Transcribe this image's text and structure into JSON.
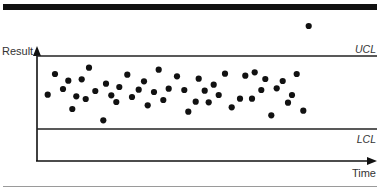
{
  "chart_data": {
    "type": "scatter",
    "title": "",
    "xlabel": "Time",
    "ylabel": "Result",
    "control_limits": [
      {
        "name": "UCL",
        "label": "UCL",
        "y_px": 56
      },
      {
        "name": "LCL",
        "label": "LCL",
        "y_px": 129
      }
    ],
    "grid": false,
    "legend": null,
    "points_px": [
      [
        47.7,
        94.7
      ],
      [
        55,
        74
      ],
      [
        63,
        89
      ],
      [
        68.3,
        80.7
      ],
      [
        72.3,
        109
      ],
      [
        76.3,
        96.3
      ],
      [
        81.7,
        79.3
      ],
      [
        85.7,
        99
      ],
      [
        89,
        67.7
      ],
      [
        95.3,
        91
      ],
      [
        103.3,
        120.3
      ],
      [
        106,
        83.7
      ],
      [
        111.3,
        95.3
      ],
      [
        116.3,
        102
      ],
      [
        119.3,
        87
      ],
      [
        127.3,
        74.7
      ],
      [
        132,
        97
      ],
      [
        138.7,
        89.7
      ],
      [
        144,
        81.3
      ],
      [
        147.7,
        105.3
      ],
      [
        154,
        92
      ],
      [
        158.7,
        69.7
      ],
      [
        163.3,
        100
      ],
      [
        168.7,
        88.7
      ],
      [
        177,
        76.3
      ],
      [
        184.3,
        90
      ],
      [
        188.3,
        111.7
      ],
      [
        195.7,
        101.7
      ],
      [
        198.7,
        78.7
      ],
      [
        204.7,
        90.7
      ],
      [
        208.7,
        102.3
      ],
      [
        213.7,
        84.7
      ],
      [
        218.7,
        95
      ],
      [
        225,
        73.7
      ],
      [
        231.7,
        107.3
      ],
      [
        240,
        98.7
      ],
      [
        245.3,
        75.7
      ],
      [
        252,
        98.7
      ],
      [
        254.7,
        72.3
      ],
      [
        261.3,
        90
      ],
      [
        265.3,
        79
      ],
      [
        271.3,
        115.3
      ],
      [
        276.7,
        88.3
      ],
      [
        282.7,
        81
      ],
      [
        288,
        102.7
      ],
      [
        292,
        95
      ],
      [
        296.7,
        74
      ],
      [
        303.3,
        110.7
      ],
      [
        308.7,
        26
      ]
    ],
    "annotations": [
      "One point above UCL (out of control)"
    ]
  },
  "labels": {
    "y_axis": "Result",
    "x_axis": "Time",
    "ucl": "UCL",
    "lcl": "LCL"
  }
}
